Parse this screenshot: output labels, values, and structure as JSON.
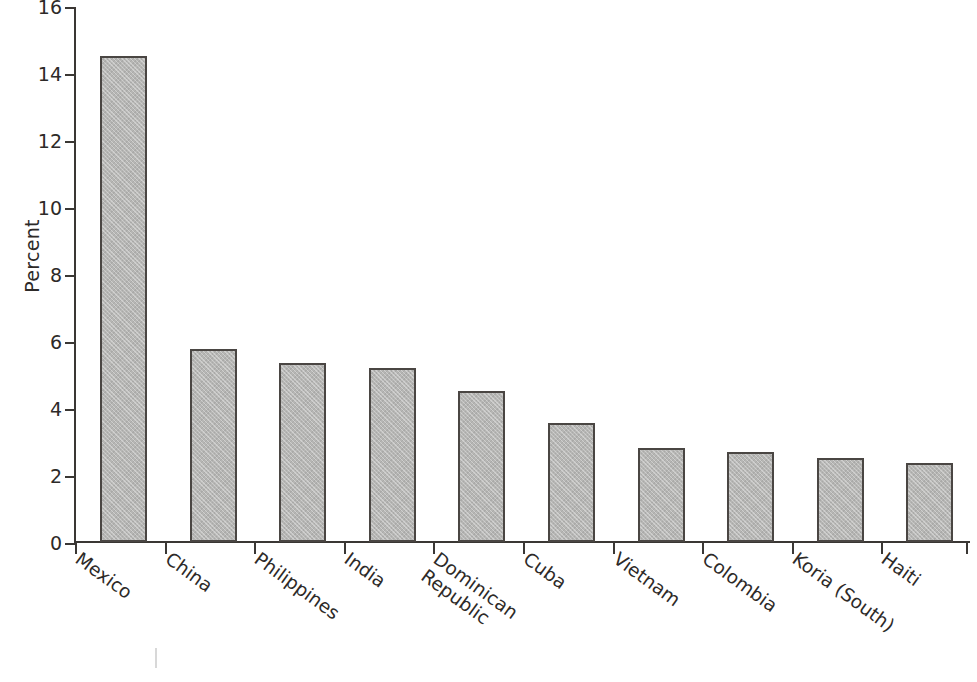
{
  "chart_data": {
    "type": "bar",
    "title": "",
    "xlabel": "",
    "ylabel": "Percent",
    "ylim": [
      0,
      16
    ],
    "yticks": [
      0,
      2,
      4,
      6,
      8,
      10,
      12,
      14,
      16
    ],
    "grid": false,
    "legend": "none",
    "categories": [
      "Mexico",
      "China",
      "Philippines",
      "India",
      "Dominican Republic",
      "Cuba",
      "Vietnam",
      "Colombia",
      "Koria (South)",
      "Haiti"
    ],
    "category_lines": [
      [
        "Mexico"
      ],
      [
        "China"
      ],
      [
        "Philippines"
      ],
      [
        "India"
      ],
      [
        "Dominican",
        "Republic"
      ],
      [
        "Cuba"
      ],
      [
        "Vietnam"
      ],
      [
        "Colombia"
      ],
      [
        "Koria (South)"
      ],
      [
        "Haiti"
      ]
    ],
    "values": [
      14.5,
      5.75,
      5.35,
      5.2,
      4.5,
      3.55,
      2.8,
      2.7,
      2.5,
      2.35
    ],
    "bar_fill_color": "#b6b6b4",
    "bar_border_color": "#4a4643",
    "axis_color": "#3a3734",
    "background_color": "#ffffff"
  }
}
